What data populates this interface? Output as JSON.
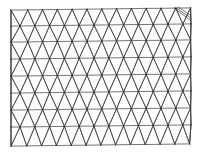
{
  "diagram": {
    "type": "triangular-mesh",
    "stroke_color": "#3a3a3a",
    "stroke_width": 0.7,
    "background": "#ffffff",
    "grid": {
      "rows": [
        {
          "y": 9,
          "x_start": 13,
          "dx": 14.8,
          "count": 13,
          "dy_slope": -0.012
        },
        {
          "y": 25,
          "x_start": 20,
          "dx": 14.8,
          "count": 12,
          "dy_slope": -0.012
        },
        {
          "y": 41,
          "x_start": 13,
          "dx": 14.8,
          "count": 13,
          "dy_slope": -0.012
        },
        {
          "y": 58,
          "x_start": 20,
          "dx": 14.8,
          "count": 12,
          "dy_slope": -0.012
        },
        {
          "y": 75,
          "x_start": 13,
          "dx": 14.8,
          "count": 13,
          "dy_slope": -0.012
        },
        {
          "y": 92,
          "x_start": 20,
          "dx": 14.8,
          "count": 12,
          "dy_slope": -0.012
        },
        {
          "y": 109,
          "x_start": 13,
          "dx": 14.8,
          "count": 13,
          "dy_slope": -0.012
        },
        {
          "y": 126,
          "x_start": 20,
          "dx": 14.8,
          "count": 12,
          "dy_slope": -0.012
        },
        {
          "y": 145,
          "x_start": 12,
          "dx": 14.8,
          "count": 13,
          "dy_slope": -0.012
        }
      ],
      "left_edge_x": 11,
      "right_edge_x": 191
    }
  }
}
